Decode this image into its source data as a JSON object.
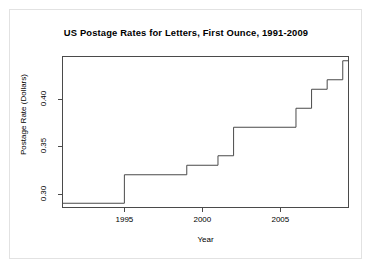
{
  "chart_data": {
    "type": "line",
    "subtype": "step",
    "title": "US Postage Rates for Letters, First Ounce, 1991-2009",
    "xlabel": "Year",
    "ylabel": "Postage Rate (Dollars)",
    "grid": false,
    "legend": null,
    "xlim": [
      1991,
      2009.4
    ],
    "ylim": [
      0.285,
      0.445
    ],
    "xticks": [
      1995,
      2000,
      2005
    ],
    "xtick_labels": [
      "1995",
      "2000",
      "2005"
    ],
    "yticks": [
      0.3,
      0.35,
      0.4
    ],
    "ytick_labels": [
      "0.30",
      "0.35",
      "0.40"
    ],
    "x": [
      1991,
      1995,
      1999,
      2001,
      2002,
      2006,
      2007,
      2008,
      2009
    ],
    "values": [
      0.29,
      0.32,
      0.33,
      0.34,
      0.37,
      0.39,
      0.41,
      0.42,
      0.44
    ],
    "series": [
      {
        "name": "US First-Class Postage Rate",
        "color": "#4a4a4a",
        "points": [
          {
            "year": 1991,
            "rate": 0.29
          },
          {
            "year": 1995,
            "rate": 0.32
          },
          {
            "year": 1999,
            "rate": 0.33
          },
          {
            "year": 2001,
            "rate": 0.34
          },
          {
            "year": 2002,
            "rate": 0.37
          },
          {
            "year": 2006,
            "rate": 0.39
          },
          {
            "year": 2007,
            "rate": 0.41
          },
          {
            "year": 2008,
            "rate": 0.42
          },
          {
            "year": 2009,
            "rate": 0.44
          }
        ]
      }
    ]
  },
  "colors": {
    "line": "#4a4a4a",
    "axis": "#4a4a4a",
    "text": "#000000",
    "frame": "#e2e2e2",
    "background": "#ffffff"
  }
}
